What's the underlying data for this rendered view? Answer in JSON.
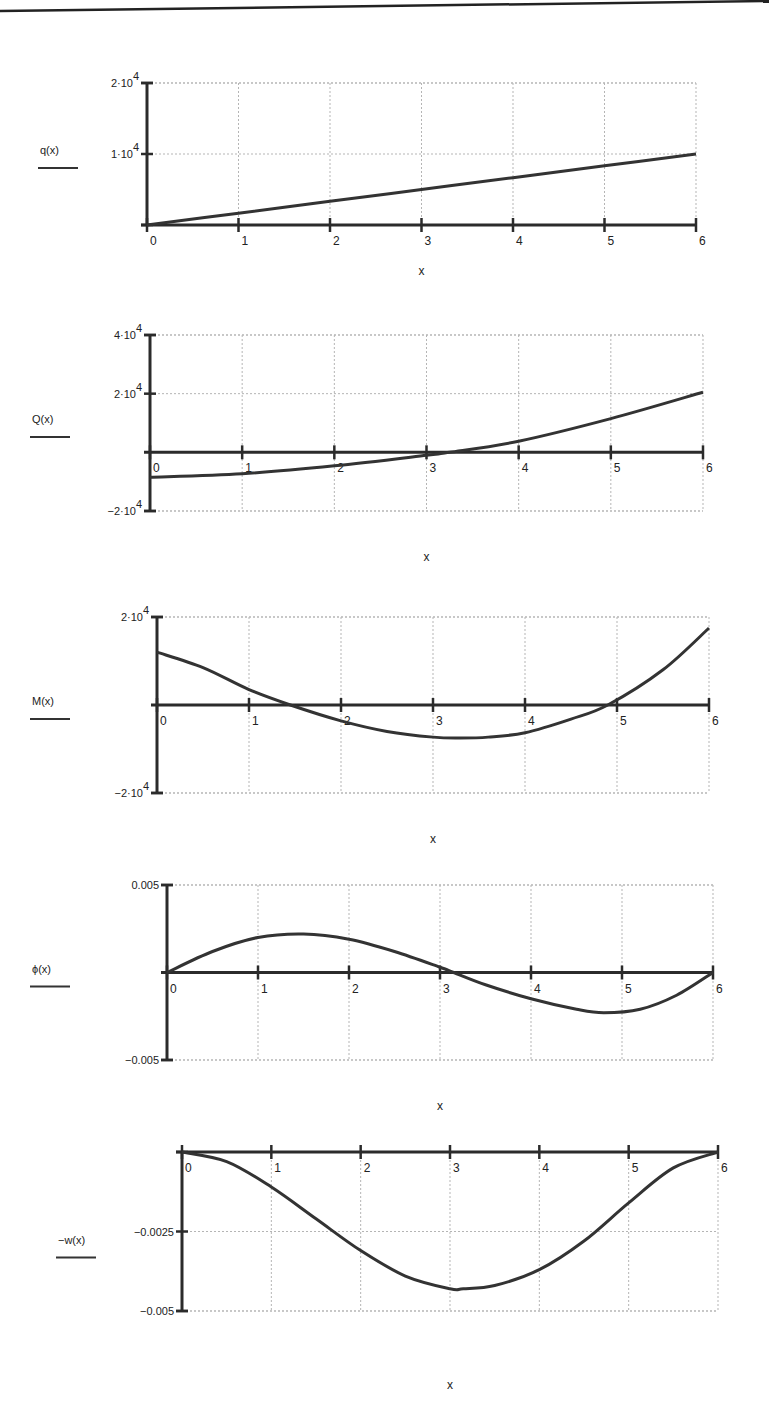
{
  "page": {
    "top_rule": true
  },
  "chart_data": [
    {
      "type": "line",
      "id": "q",
      "function_label": "q(x)",
      "xlabel": "x",
      "x_ticks": [
        "0",
        "1",
        "2",
        "3",
        "4",
        "5",
        "6"
      ],
      "y_tick_labels": [
        "2·10⁴",
        "1·10⁴"
      ],
      "y_ticks": [
        20000,
        10000
      ],
      "ylim": [
        0,
        20000
      ],
      "xlim": [
        0,
        6
      ],
      "grid": true,
      "x": [
        0,
        1,
        2,
        3,
        4,
        5,
        6
      ],
      "values": [
        0,
        1667,
        3333,
        5000,
        6667,
        8333,
        10000
      ],
      "frame": {
        "top": 83,
        "bottom": 225,
        "left": 147,
        "right": 696,
        "x_axis_y_value": 0
      }
    },
    {
      "type": "line",
      "id": "Q",
      "function_label": "Q(x)",
      "xlabel": "x",
      "x_ticks": [
        "0",
        "1",
        "2",
        "3",
        "4",
        "5",
        "6"
      ],
      "y_tick_labels": [
        "4·10⁴",
        "2·10⁴",
        "−2·10⁴"
      ],
      "y_ticks": [
        40000,
        20000,
        -20000
      ],
      "ylim": [
        -20000,
        40000
      ],
      "xlim": [
        0,
        6
      ],
      "grid": true,
      "x": [
        0,
        1,
        2,
        3,
        3.25,
        4,
        5,
        6
      ],
      "values": [
        -8500,
        -7300,
        -4600,
        -1000,
        0,
        3800,
        11500,
        20500
      ],
      "frame": {
        "top": 335,
        "bottom": 511,
        "left": 150,
        "right": 703,
        "x_axis_y_value": 0
      }
    },
    {
      "type": "line",
      "id": "M",
      "function_label": "M(x)",
      "xlabel": "x",
      "x_ticks": [
        "0",
        "1",
        "2",
        "3",
        "4",
        "5",
        "6"
      ],
      "y_tick_labels": [
        "2·10⁴",
        "−2·10⁴"
      ],
      "y_ticks": [
        20000,
        -20000
      ],
      "ylim": [
        -20000,
        20000
      ],
      "xlim": [
        0,
        6
      ],
      "grid": true,
      "x": [
        0,
        0.5,
        1,
        1.45,
        2,
        2.5,
        3,
        3.3,
        3.6,
        4,
        4.5,
        4.9,
        5.5,
        6
      ],
      "values": [
        12000,
        8500,
        3500,
        0,
        -3600,
        -6000,
        -7300,
        -7500,
        -7300,
        -6300,
        -3200,
        0,
        8000,
        17500
      ],
      "frame": {
        "top": 617,
        "bottom": 793,
        "left": 157,
        "right": 709,
        "x_axis_y_value": 0
      }
    },
    {
      "type": "line",
      "id": "phi",
      "function_label": "ϕ(x)",
      "xlabel": "x",
      "x_ticks": [
        "0",
        "1",
        "2",
        "3",
        "4",
        "5",
        "6"
      ],
      "y_tick_labels": [
        "0.005",
        "−0.005"
      ],
      "y_ticks": [
        0.005,
        -0.005
      ],
      "ylim": [
        -0.005,
        0.005
      ],
      "xlim": [
        0,
        6
      ],
      "grid": true,
      "x": [
        0,
        0.5,
        1,
        1.5,
        2,
        2.5,
        3,
        3.15,
        3.5,
        4,
        4.5,
        4.8,
        5.2,
        5.6,
        6
      ],
      "values": [
        0,
        0.0012,
        0.002,
        0.0022,
        0.0019,
        0.0012,
        0.0003,
        0,
        -0.0007,
        -0.0015,
        -0.0021,
        -0.0023,
        -0.0021,
        -0.0013,
        0
      ],
      "frame": {
        "top": 885,
        "bottom": 1060,
        "left": 167,
        "right": 713,
        "x_axis_y_value": 0
      }
    },
    {
      "type": "line",
      "id": "w",
      "function_label": "−w(x)",
      "xlabel": "x",
      "x_ticks": [
        "0",
        "1",
        "2",
        "3",
        "4",
        "5",
        "6"
      ],
      "y_tick_labels": [
        "−0.0025",
        "−0.005"
      ],
      "y_ticks": [
        -0.0025,
        -0.005
      ],
      "ylim": [
        -0.005,
        0
      ],
      "xlim": [
        0,
        6
      ],
      "grid": true,
      "x": [
        0,
        0.5,
        1,
        1.5,
        2,
        2.5,
        3,
        3.15,
        3.5,
        4,
        4.5,
        5,
        5.5,
        6
      ],
      "values": [
        0,
        -0.0003,
        -0.0011,
        -0.0021,
        -0.0031,
        -0.0039,
        -0.0043,
        -0.0043,
        -0.0042,
        -0.0037,
        -0.0028,
        -0.0016,
        -0.0005,
        0
      ],
      "frame": {
        "top": 1152,
        "bottom": 1311,
        "left": 182,
        "right": 718,
        "x_axis_y_value": 0
      }
    }
  ],
  "labels": {
    "q": {
      "fn": "q(x)",
      "x": "x",
      "y0": "2·10",
      "y0e": "4",
      "y1": "1·10",
      "y1e": "4"
    },
    "Q": {
      "fn": "Q(x)",
      "x": "x",
      "y0": "4·10",
      "y0e": "4",
      "y1": "2·10",
      "y1e": "4",
      "y2": "−2·10",
      "y2e": "4"
    },
    "M": {
      "fn": "M(x)",
      "x": "x",
      "y0": "2·10",
      "y0e": "4",
      "y1": "−2·10",
      "y1e": "4"
    },
    "phi": {
      "fn": "ϕ(x)",
      "x": "x",
      "y0": "0.005",
      "y1": "−0.005"
    },
    "w": {
      "fn": "−w(x)",
      "x": "x",
      "y0": "−0.0025",
      "y1": "−0.005"
    },
    "ticks": [
      "0",
      "1",
      "2",
      "3",
      "4",
      "5",
      "6"
    ]
  }
}
